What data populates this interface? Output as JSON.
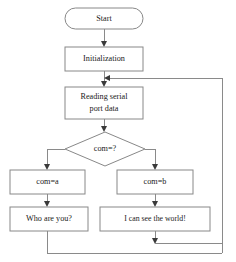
{
  "diagram": {
    "type": "flowchart",
    "colors": {
      "background": "#ffffff",
      "node_fill": "#ffffff",
      "node_stroke": "#888888",
      "connector": "#8a8a8a",
      "arrow": "#3a3a3a",
      "text": "#1a1a1a"
    },
    "nodes": {
      "start": {
        "label": "Start",
        "shape": "terminator"
      },
      "initialization": {
        "label": "Initialization",
        "shape": "process"
      },
      "reading": {
        "label": "Reading serial port data",
        "line1": "Reading serial",
        "line2": "port data",
        "shape": "process"
      },
      "decision": {
        "label": "com=?",
        "shape": "decision"
      },
      "branch_a": {
        "label": "com=a",
        "shape": "process"
      },
      "branch_b": {
        "label": "com=b",
        "shape": "process"
      },
      "output_a": {
        "label": "Who are you?",
        "shape": "process"
      },
      "output_b": {
        "label": "I can see the world!",
        "shape": "process"
      }
    },
    "edges": [
      {
        "from": "start",
        "to": "initialization"
      },
      {
        "from": "initialization",
        "to": "reading"
      },
      {
        "from": "reading",
        "to": "decision"
      },
      {
        "from": "decision",
        "to": "branch_a"
      },
      {
        "from": "decision",
        "to": "branch_b"
      },
      {
        "from": "branch_a",
        "to": "output_a"
      },
      {
        "from": "branch_b",
        "to": "output_b"
      },
      {
        "from": "output_a",
        "to": "merge"
      },
      {
        "from": "output_b",
        "to": "merge"
      },
      {
        "from": "merge",
        "to": "reading"
      }
    ]
  }
}
